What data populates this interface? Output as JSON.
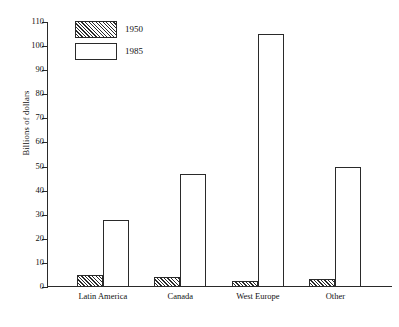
{
  "chart_data": {
    "type": "bar",
    "title": "",
    "subtitle": "",
    "xlabel": "",
    "ylabel": "Billions of dollars",
    "categories": [
      "Latin America",
      "Canada",
      "West Europe",
      "Other"
    ],
    "series": [
      {
        "name": "1950",
        "values": [
          5,
          4,
          2.5,
          3.5
        ],
        "fill": "hatched-diagonal"
      },
      {
        "name": "1985",
        "values": [
          28,
          47,
          105,
          50
        ],
        "fill": "white-outline"
      }
    ],
    "ylim": [
      0,
      110
    ],
    "ytick_labels": [
      "0",
      "10",
      "20",
      "30",
      "40",
      "50",
      "60",
      "70",
      "80",
      "90",
      "100",
      "110"
    ],
    "ytick_values": [
      0,
      10,
      20,
      30,
      40,
      50,
      60,
      70,
      80,
      90,
      100,
      110
    ],
    "grid": false,
    "legend_position": "top-left-inside",
    "legend": [
      "1950",
      "1985"
    ],
    "annotations": [],
    "colors": {
      "axis": "#2a2a2a",
      "bar_outline": "#2a2a2a",
      "bar_fill_1985": "#ffffff",
      "hatch": "#2a2a2a",
      "background": "#ffffff",
      "text": "#111111"
    }
  }
}
